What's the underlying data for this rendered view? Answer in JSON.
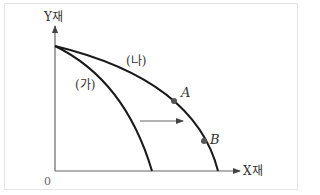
{
  "diagram": {
    "type": "production-possibility-frontier",
    "y_axis_label": "Y재",
    "x_axis_label": "X재",
    "origin_label": "0",
    "curves": [
      {
        "label": "(가)",
        "description": "inner frontier"
      },
      {
        "label": "(나)",
        "description": "outer frontier"
      }
    ],
    "points": [
      {
        "label": "A",
        "on_curve": "(나)"
      },
      {
        "label": "B",
        "on_curve": "(나)"
      }
    ],
    "shift_arrow": "rightward shift from (가) to (나)",
    "colors": {
      "curve": "#1a1a1a",
      "axis": "#555555",
      "arrow": "#555555",
      "point": "#555555",
      "border": "#e4e4e4"
    }
  }
}
